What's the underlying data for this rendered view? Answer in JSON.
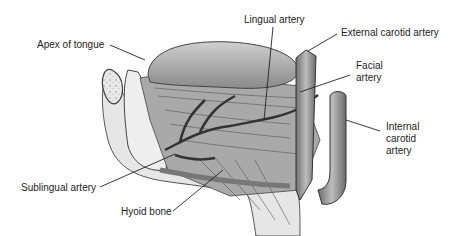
{
  "figure": {
    "labels": [
      {
        "id": "apex",
        "text": "Apex of tongue"
      },
      {
        "id": "lingual",
        "text": "Lingual artery"
      },
      {
        "id": "ext_carotid",
        "text": "External carotid artery"
      },
      {
        "id": "facial_1",
        "text": "Facial"
      },
      {
        "id": "facial_2",
        "text": "artery"
      },
      {
        "id": "int_carotid_1",
        "text": "Internal"
      },
      {
        "id": "int_carotid_2",
        "text": "carotid"
      },
      {
        "id": "int_carotid_3",
        "text": "artery"
      },
      {
        "id": "sublingual",
        "text": "Sublingual artery"
      },
      {
        "id": "hyoid",
        "text": "Hyoid bone"
      }
    ]
  }
}
